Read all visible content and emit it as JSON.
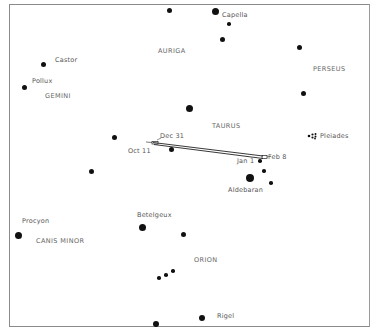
{
  "constellations": [
    {
      "name": "AURIGA",
      "x": 158,
      "y": 47
    },
    {
      "name": "GEMINI",
      "x": 45,
      "y": 92
    },
    {
      "name": "PERSEUS",
      "x": 313,
      "y": 65
    },
    {
      "name": "TAURUS",
      "x": 212,
      "y": 122
    },
    {
      "name": "CANIS MINOR",
      "x": 36,
      "y": 237
    },
    {
      "name": "ORION",
      "x": 194,
      "y": 256
    }
  ],
  "stars": [
    {
      "name": "",
      "x": 169,
      "y": 10,
      "r": 2.5
    },
    {
      "name": "Capella",
      "x": 215,
      "y": 11,
      "r": 3.5,
      "lx": 222,
      "ly": 11
    },
    {
      "name": "",
      "x": 229,
      "y": 24,
      "r": 1.8
    },
    {
      "name": "",
      "x": 222,
      "y": 39,
      "r": 2.5
    },
    {
      "name": "",
      "x": 299,
      "y": 47,
      "r": 2.5
    },
    {
      "name": "Castor",
      "x": 43,
      "y": 64,
      "r": 2.5,
      "lx": 55,
      "ly": 56
    },
    {
      "name": "Pollux",
      "x": 24,
      "y": 87,
      "r": 2.5,
      "lx": 32,
      "ly": 77
    },
    {
      "name": "",
      "x": 303,
      "y": 93,
      "r": 2.5
    },
    {
      "name": "",
      "x": 189,
      "y": 108,
      "r": 3.5
    },
    {
      "name": "",
      "x": 114,
      "y": 137,
      "r": 2.5
    },
    {
      "name": "",
      "x": 171,
      "y": 149,
      "r": 2.5
    },
    {
      "name": "",
      "x": 91,
      "y": 171,
      "r": 2.5
    },
    {
      "name": "",
      "x": 260,
      "y": 161,
      "r": 1.8
    },
    {
      "name": "",
      "x": 264,
      "y": 171,
      "r": 1.8
    },
    {
      "name": "Aldebaran",
      "x": 250,
      "y": 178,
      "r": 4,
      "lx": 228,
      "ly": 186
    },
    {
      "name": "",
      "x": 271,
      "y": 183,
      "r": 1.8
    },
    {
      "name": "Betelgeux",
      "x": 142,
      "y": 227,
      "r": 3.5,
      "lx": 137,
      "ly": 211
    },
    {
      "name": "Procyon",
      "x": 18,
      "y": 235,
      "r": 3.5,
      "lx": 22,
      "ly": 217
    },
    {
      "name": "",
      "x": 183,
      "y": 234,
      "r": 2.5
    },
    {
      "name": "",
      "x": 159,
      "y": 278,
      "r": 1.8
    },
    {
      "name": "",
      "x": 166,
      "y": 275,
      "r": 1.8
    },
    {
      "name": "",
      "x": 173,
      "y": 271,
      "r": 1.8
    },
    {
      "name": "Rigel",
      "x": 202,
      "y": 318,
      "r": 3,
      "lx": 217,
      "ly": 312
    },
    {
      "name": "",
      "x": 156,
      "y": 324,
      "r": 3
    }
  ],
  "pleiades": {
    "label": "Pleiades",
    "x": 312,
    "y": 136,
    "lx": 320,
    "ly": 132
  },
  "planet_path": {
    "dates": [
      {
        "label": "Oct 11",
        "x": 128,
        "y": 147
      },
      {
        "label": "Dec 31",
        "x": 160,
        "y": 132
      },
      {
        "label": "Jan 1",
        "x": 237,
        "y": 157
      },
      {
        "label": "Feb 8",
        "x": 268,
        "y": 153
      }
    ]
  }
}
